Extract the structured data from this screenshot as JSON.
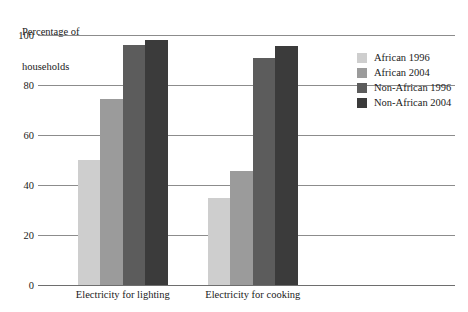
{
  "chart_data": {
    "type": "bar",
    "title": "Percentage of households",
    "title_lines": [
      "Percentage of",
      "households"
    ],
    "xlabel": "",
    "ylabel": "Percentage of households",
    "categories": [
      "Electricity for lighting",
      "Electricity for cooking"
    ],
    "series": [
      {
        "name": "African 1996",
        "color": "#cecece",
        "values": [
          50,
          35
        ]
      },
      {
        "name": "African 2004",
        "color": "#9b9b9b",
        "values": [
          74.5,
          45.5
        ]
      },
      {
        "name": "Non-African 1996",
        "color": "#5c5c5c",
        "values": [
          96,
          91
        ]
      },
      {
        "name": "Non-African 2004",
        "color": "#3b3b3b",
        "values": [
          98,
          95.5
        ]
      }
    ],
    "ylim": [
      0,
      100
    ],
    "yticks": [
      0,
      20,
      40,
      60,
      80,
      100
    ],
    "ytick_labels": [
      "0",
      "20",
      "40",
      "60",
      "80",
      "100"
    ],
    "grid": true,
    "grid_axis": "y",
    "legend_position": "right",
    "legend_entries": [
      "African 1996",
      "African 2004",
      "Non-African 1996",
      "Non-African 2004"
    ]
  },
  "colors": {
    "background": "#ffffff",
    "gridline": "#8c8c8c",
    "baseline": "#6e6e6e",
    "text": "#1a1a1a"
  }
}
